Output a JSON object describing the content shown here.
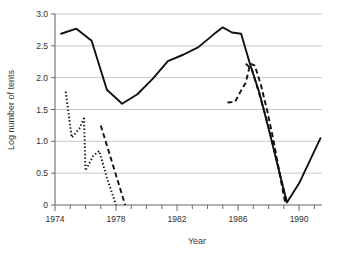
{
  "chart_data": {
    "type": "line",
    "title": "",
    "xlabel": "Year",
    "ylabel": "Log number of tents",
    "xlim": [
      1974,
      1991.5
    ],
    "ylim": [
      0,
      3.0
    ],
    "xticks": [
      1974,
      1975,
      1976,
      1977,
      1978,
      1979,
      1980,
      1981,
      1982,
      1983,
      1984,
      1985,
      1986,
      1987,
      1988,
      1989,
      1990,
      1991
    ],
    "xticklabels": [
      "1974",
      "",
      "",
      "",
      "1978",
      "",
      "",
      "",
      "1982",
      "",
      "",
      "",
      "1986",
      "",
      "",
      "",
      "1990",
      ""
    ],
    "yticks": [
      0,
      0.5,
      1.0,
      1.5,
      2.0,
      2.5,
      3.0
    ],
    "yticklabels": [
      "0",
      "0.5",
      "1.0",
      "1.5",
      "2.0",
      "2.5",
      "3.0"
    ],
    "grid": "horizontal",
    "legend": "none",
    "series": [
      {
        "name": "solid-series",
        "style": "solid",
        "color": "#111111",
        "x": [
          1974.4,
          1975.4,
          1976.4,
          1977.4,
          1978.4,
          1979.4,
          1980.4,
          1981.4,
          1982.4,
          1983.4,
          1984.4,
          1985.0,
          1985.6,
          1986.2,
          1986.8,
          1987.4,
          1988.0,
          1988.6,
          1989.2,
          1990.0,
          1991.4
        ],
        "y": [
          2.69,
          2.77,
          2.58,
          1.81,
          1.59,
          1.74,
          1.98,
          2.26,
          2.36,
          2.48,
          2.68,
          2.79,
          2.71,
          2.69,
          2.2,
          1.76,
          1.2,
          0.62,
          0.04,
          0.34,
          1.05
        ]
      },
      {
        "name": "dashed-series-late-a",
        "style": "dashed",
        "color": "#111111",
        "x": [
          1985.3,
          1985.8,
          1986.2,
          1986.5,
          1986.8,
          1987.1,
          1987.5,
          1987.9,
          1988.3,
          1988.7,
          1989.1
        ],
        "y": [
          1.61,
          1.62,
          1.8,
          1.92,
          2.22,
          2.19,
          1.88,
          1.49,
          1.04,
          0.52,
          0.02
        ]
      },
      {
        "name": "dashed-series-late-b",
        "style": "dashed",
        "color": "#111111",
        "x": [
          1986.5,
          1986.9,
          1987.3,
          1987.8,
          1988.3,
          1988.8,
          1989.2
        ],
        "y": [
          2.22,
          2.13,
          1.82,
          1.4,
          0.93,
          0.42,
          0.02
        ]
      },
      {
        "name": "dashed-series-early",
        "style": "dashed",
        "color": "#111111",
        "x": [
          1977.0,
          1978.6
        ],
        "y": [
          1.25,
          0.0
        ]
      },
      {
        "name": "dotted-series-a",
        "style": "dotted",
        "color": "#111111",
        "x": [
          1974.7,
          1975.1,
          1975.6,
          1975.9
        ],
        "y": [
          1.78,
          1.06,
          1.2,
          1.37
        ]
      },
      {
        "name": "dotted-series-b",
        "style": "dotted",
        "color": "#111111",
        "x": [
          1975.9,
          1976.0,
          1976.5,
          1976.9,
          1977.4,
          1978.0
        ],
        "y": [
          1.37,
          0.54,
          0.77,
          0.85,
          0.43,
          0.0
        ]
      }
    ]
  }
}
